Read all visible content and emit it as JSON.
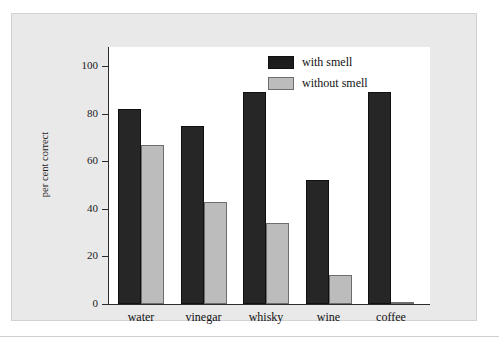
{
  "chart_data": {
    "type": "bar",
    "title": "",
    "xlabel": "",
    "ylabel": "per cent correct",
    "ylim": [
      0,
      108
    ],
    "yticks": [
      0,
      20,
      40,
      60,
      80,
      100
    ],
    "ytick_labels": [
      "0",
      "20",
      "40",
      "60",
      "80",
      "100"
    ],
    "grid": false,
    "legend_position": "top-right",
    "categories": [
      "water",
      "vinegar",
      "whisky",
      "wine",
      "coffee"
    ],
    "series": [
      {
        "name": "with smell",
        "color": "#262626",
        "values": [
          82,
          75,
          89,
          52,
          89
        ]
      },
      {
        "name": "without smell",
        "color": "#bcbcbc",
        "values": [
          67,
          43,
          34,
          12,
          1
        ]
      }
    ]
  },
  "figure": {
    "panel_background": "#e9e9e9",
    "plot_background": "#ffffff",
    "axis_color": "#2b2b2b"
  }
}
